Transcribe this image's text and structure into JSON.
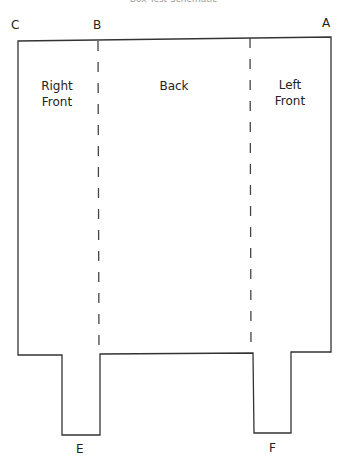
{
  "header": {
    "title": "Box Test Schematic"
  },
  "diagram": {
    "corner_labels": {
      "a": "A",
      "b": "B",
      "c": "C",
      "e": "E",
      "f": "F"
    },
    "panels": {
      "right_front": {
        "line1": "Right",
        "line2": "Front"
      },
      "back": {
        "line1": "Back"
      },
      "left_front": {
        "line1": "Left",
        "line2": "Front"
      }
    },
    "colors": {
      "stroke": "#333333",
      "dash": "#444444",
      "text": "#222222"
    }
  }
}
